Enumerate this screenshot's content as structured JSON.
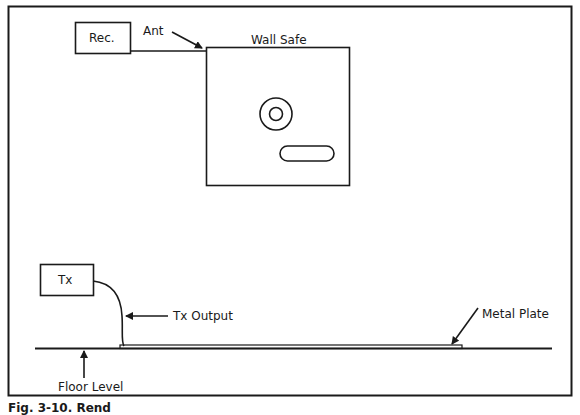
{
  "figure": {
    "caption": "Fig. 3-10. Rend",
    "colors": {
      "ink": "#1a1a1a",
      "background": "#ffffff"
    }
  },
  "receiver": {
    "label": "Rec."
  },
  "antenna": {
    "label": "Ant"
  },
  "wall_safe": {
    "label": "Wall Safe"
  },
  "transmitter": {
    "label": "Tx"
  },
  "tx_output": {
    "label": "Tx Output"
  },
  "metal_plate": {
    "label": "Metal Plate"
  },
  "floor": {
    "label": "Floor Level"
  }
}
